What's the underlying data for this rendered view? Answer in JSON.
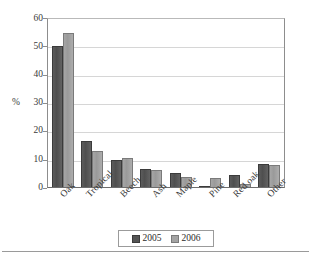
{
  "chart_data": {
    "type": "bar",
    "title": "",
    "subtitle": "",
    "xlabel": "",
    "ylabel": "%",
    "ylim": [
      0,
      60
    ],
    "ytick_step": 10,
    "yticks": [
      0,
      10,
      20,
      30,
      40,
      50,
      60
    ],
    "ytick_labels": [
      "0",
      "10",
      "20",
      "30",
      "40",
      "50",
      "60"
    ],
    "grid": true,
    "grid_axis": "y",
    "legend_position": "bottom",
    "categories": [
      "Oak",
      "Tropical",
      "Beech",
      "Ash",
      "Maple",
      "Pine",
      "Red oak",
      "Other"
    ],
    "series": [
      {
        "name": "2005",
        "color": "#545454",
        "values": [
          50.2,
          16.6,
          9.5,
          6.5,
          4.9,
          0.2,
          4.3,
          8.2
        ]
      },
      {
        "name": "2006",
        "color": "#a3a3a3",
        "values": [
          55.1,
          13.0,
          10.3,
          6.0,
          3.6,
          3.3,
          1.0,
          7.9
        ]
      }
    ]
  },
  "legend": {
    "items": [
      {
        "label": "2005",
        "swatch": "legend-swatch-2005"
      },
      {
        "label": "2006",
        "swatch": "legend-swatch-2006"
      }
    ]
  },
  "axis": {
    "y_title": "%"
  }
}
